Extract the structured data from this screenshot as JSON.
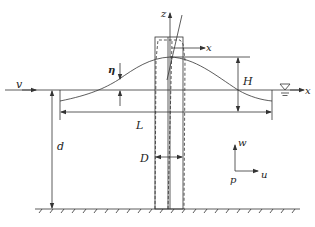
{
  "figure": {
    "type": "wave-pile interaction schematic",
    "colors": {
      "line": "#333333",
      "background": "#ffffff"
    },
    "labels": {
      "z_axis": "z",
      "x_local": "x",
      "x_global": "x",
      "velocity": "v",
      "eta": "η",
      "wave_height": "H",
      "wavelength": "L",
      "depth": "d",
      "diameter": "D",
      "w": "w",
      "u": "u",
      "p": "p"
    },
    "symbols": {
      "water_level": "still-water-level-icon"
    }
  }
}
